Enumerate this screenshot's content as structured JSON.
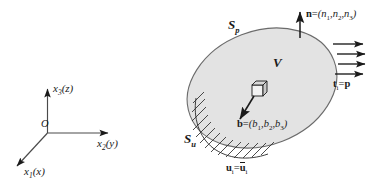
{
  "figure": {
    "background_color": "#ffffff",
    "line_color": "#1a1a1a",
    "body_fill_color": "#e3e3e3",
    "body_stroke_color": "#555555"
  },
  "axes": {
    "origin_label": "O",
    "vertical": {
      "name": "x3",
      "symbol": "x",
      "subscript": "3",
      "alias": "(z)",
      "label": "x3(z)"
    },
    "horizontal": {
      "name": "x2",
      "symbol": "x",
      "subscript": "2",
      "alias": "(y)",
      "label": "x2(y)"
    },
    "oblique": {
      "name": "x1",
      "symbol": "x",
      "subscript": "1",
      "alias": "(x)",
      "label": "x1(x)"
    }
  },
  "body": {
    "volume_label": "V",
    "traction_surface_label": "S",
    "traction_surface_subscript": "p",
    "displacement_surface_label": "S",
    "displacement_surface_subscript": "u"
  },
  "vectors": {
    "normal": {
      "symbol": "n",
      "equals": "=",
      "components_open": "(",
      "c1": "n",
      "c1_sub": "1",
      "sep1": ",",
      "c2": "n",
      "c2_sub": "2",
      "sep2": ",",
      "c3": "n",
      "c3_sub": "3",
      "components_close": ")",
      "label": "n = (n1, n2, n3)"
    },
    "body_force": {
      "symbol": "b",
      "equals": "=",
      "components_open": "(",
      "c1": "b",
      "c1_sub": "1",
      "sep1": ",",
      "c2": "b",
      "c2_sub": "2",
      "sep2": ",",
      "c3": "b",
      "c3_sub": "3",
      "components_close": ")",
      "label": "b = (b1, b2, b3)"
    },
    "traction": {
      "symbol": "t",
      "subscript": "i",
      "equals": "=",
      "value": "p",
      "label": "ti = p"
    },
    "displacement": {
      "symbol": "u",
      "subscript": "i",
      "equals": "=",
      "value": "u",
      "value_subscript": "i",
      "label": "ui = ui"
    }
  },
  "elements": {
    "cube_label": "differential-volume-element",
    "traction_arrow_count": 4
  }
}
